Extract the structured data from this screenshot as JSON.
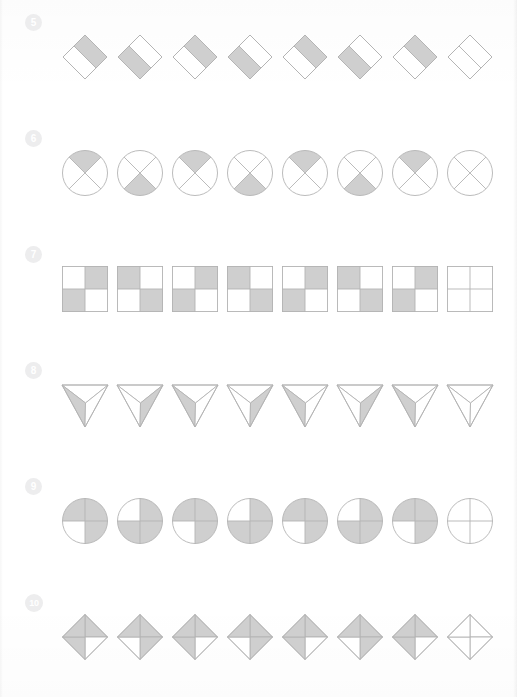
{
  "page": {
    "background_color": "#ffffff",
    "fill_color": "#cfcfcf",
    "stroke_color": "#b3b3b3",
    "badge_color": "#ededee",
    "badge_text_color": "#ffffff"
  },
  "rows": [
    {
      "number": "5",
      "shape_type": "diamond-half-split",
      "description": "Rotated square split by a diagonal band; shaded half alternates sides",
      "items": [
        {
          "index": 1,
          "shaded_part": "upper-right",
          "blank": false
        },
        {
          "index": 2,
          "shaded_part": "lower-left",
          "blank": false
        },
        {
          "index": 3,
          "shaded_part": "upper-right",
          "blank": false
        },
        {
          "index": 4,
          "shaded_part": "lower-left",
          "blank": false
        },
        {
          "index": 5,
          "shaded_part": "upper-right",
          "blank": false
        },
        {
          "index": 6,
          "shaded_part": "lower-left",
          "blank": false
        },
        {
          "index": 7,
          "shaded_part": "upper-right",
          "blank": false
        },
        {
          "index": 8,
          "shaded_part": "none",
          "blank": true
        }
      ]
    },
    {
      "number": "6",
      "shape_type": "circle-x-quadrant",
      "description": "Circle with an X cross; one quadrant shaded, alternating top and bottom",
      "items": [
        {
          "index": 1,
          "shaded_part": "top",
          "blank": false
        },
        {
          "index": 2,
          "shaded_part": "bottom",
          "blank": false
        },
        {
          "index": 3,
          "shaded_part": "top",
          "blank": false
        },
        {
          "index": 4,
          "shaded_part": "bottom",
          "blank": false
        },
        {
          "index": 5,
          "shaded_part": "top",
          "blank": false
        },
        {
          "index": 6,
          "shaded_part": "bottom",
          "blank": false
        },
        {
          "index": 7,
          "shaded_part": "top",
          "blank": false
        },
        {
          "index": 8,
          "shaded_part": "none",
          "blank": true
        }
      ]
    },
    {
      "number": "7",
      "shape_type": "square-2x2-checker",
      "description": "2x2 grid square; two opposite cells shaded, diagonal alternates",
      "items": [
        {
          "index": 1,
          "shaded_part": "tr-bl",
          "blank": false
        },
        {
          "index": 2,
          "shaded_part": "tl-br",
          "blank": false
        },
        {
          "index": 3,
          "shaded_part": "tr-bl",
          "blank": false
        },
        {
          "index": 4,
          "shaded_part": "tl-br",
          "blank": false
        },
        {
          "index": 5,
          "shaded_part": "tr-bl",
          "blank": false
        },
        {
          "index": 6,
          "shaded_part": "tl-br",
          "blank": false
        },
        {
          "index": 7,
          "shaded_part": "tr-bl",
          "blank": false
        },
        {
          "index": 8,
          "shaded_part": "none",
          "blank": true
        }
      ]
    },
    {
      "number": "8",
      "shape_type": "triangle-three-sector",
      "description": "Downward triangle split into three sectors from an inner point; one sector shaded",
      "items": [
        {
          "index": 1,
          "shaded_part": "left",
          "blank": false
        },
        {
          "index": 2,
          "shaded_part": "right",
          "blank": false
        },
        {
          "index": 3,
          "shaded_part": "left",
          "blank": false
        },
        {
          "index": 4,
          "shaded_part": "right",
          "blank": false
        },
        {
          "index": 5,
          "shaded_part": "left",
          "blank": false
        },
        {
          "index": 6,
          "shaded_part": "right",
          "blank": false
        },
        {
          "index": 7,
          "shaded_part": "left",
          "blank": false
        },
        {
          "index": 8,
          "shaded_part": "none",
          "blank": true
        }
      ]
    },
    {
      "number": "9",
      "shape_type": "circle-quadrants",
      "description": "Circle split into four quadrants; three shaded, the white quadrant alternates",
      "items": [
        {
          "index": 1,
          "shaded_part": "white-bl",
          "blank": false
        },
        {
          "index": 2,
          "shaded_part": "white-tl",
          "blank": false
        },
        {
          "index": 3,
          "shaded_part": "white-bl",
          "blank": false
        },
        {
          "index": 4,
          "shaded_part": "white-tl",
          "blank": false
        },
        {
          "index": 5,
          "shaded_part": "white-bl",
          "blank": false
        },
        {
          "index": 6,
          "shaded_part": "white-tl",
          "blank": false
        },
        {
          "index": 7,
          "shaded_part": "white-bl",
          "blank": false
        },
        {
          "index": 8,
          "shaded_part": "none",
          "blank": true
        }
      ]
    },
    {
      "number": "10",
      "shape_type": "diamond-quadrants",
      "description": "Diamond split into four triangles; three shaded, the white triangle alternates",
      "items": [
        {
          "index": 1,
          "shaded_part": "white-right",
          "blank": false
        },
        {
          "index": 2,
          "shaded_part": "white-bottom",
          "blank": false
        },
        {
          "index": 3,
          "shaded_part": "white-right",
          "blank": false
        },
        {
          "index": 4,
          "shaded_part": "white-bottom",
          "blank": false
        },
        {
          "index": 5,
          "shaded_part": "white-right",
          "blank": false
        },
        {
          "index": 6,
          "shaded_part": "white-bottom",
          "blank": false
        },
        {
          "index": 7,
          "shaded_part": "white-right",
          "blank": false
        },
        {
          "index": 8,
          "shaded_part": "none",
          "blank": true
        }
      ]
    }
  ]
}
